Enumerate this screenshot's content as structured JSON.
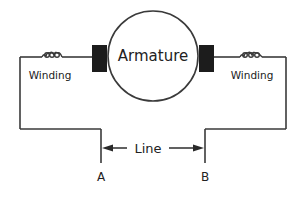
{
  "diagram": {
    "type": "dc-motor-circuit",
    "armature": {
      "label": "Armature"
    },
    "windings": [
      {
        "id": "left",
        "label": "Winding"
      },
      {
        "id": "right",
        "label": "Winding"
      }
    ],
    "line": {
      "label": "Line"
    },
    "terminals": [
      {
        "id": "a",
        "label": "A"
      },
      {
        "id": "b",
        "label": "B"
      }
    ],
    "colors": {
      "stroke": "#3a3a3a",
      "brush": "#1c1c1c",
      "background": "#ffffff"
    }
  }
}
